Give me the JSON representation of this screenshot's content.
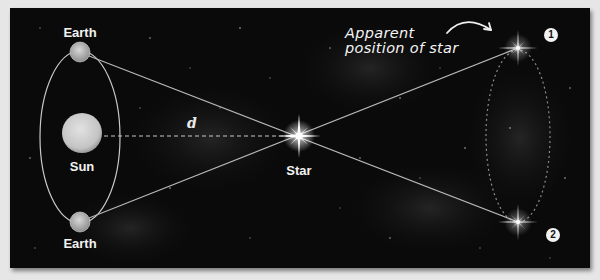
{
  "diagram": {
    "colors": {
      "page_background": "#e6e6e6",
      "space_background": "#0a0a0a",
      "line": "#bdbdbd",
      "text": "#f2f2f2",
      "sun": "#cfcfcf",
      "earth": "#bcbcbc"
    },
    "labels": {
      "earth_top": "Earth",
      "earth_bottom": "Earth",
      "sun": "Sun",
      "star": "Star",
      "distance": "d",
      "apparent_line1": "Apparent",
      "apparent_line2": "position of star",
      "position_1": "1",
      "position_2": "2"
    },
    "objects": {
      "sun": {
        "cx": 72,
        "cy": 125,
        "r": 20
      },
      "earth_top": {
        "cx": 70,
        "cy": 44,
        "r": 10
      },
      "earth_bottom": {
        "cx": 70,
        "cy": 214,
        "r": 10
      },
      "earth_orbit": {
        "cx": 70,
        "cy": 129,
        "rx": 40,
        "ry": 90
      },
      "star": {
        "cx": 289,
        "cy": 128
      },
      "apparent_star_1": {
        "cx": 508,
        "cy": 40
      },
      "apparent_star_2": {
        "cx": 508,
        "cy": 214
      },
      "apparent_path": {
        "cx": 508,
        "cy": 128,
        "rx": 32,
        "ry": 88
      }
    }
  }
}
